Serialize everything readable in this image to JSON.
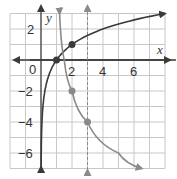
{
  "chart_data": {
    "type": "line",
    "title": "",
    "xlabel": "x",
    "ylabel": "y",
    "xlim": [
      -2,
      8
    ],
    "ylim": [
      -7,
      3
    ],
    "grid": true,
    "x_tick_labels": [
      "0",
      "2",
      "4",
      "6"
    ],
    "y_tick_labels": [
      "2",
      "-2",
      "-4",
      "-6"
    ],
    "series": [
      {
        "name": "dark curve",
        "color": "#3a3a3a",
        "style": "solid",
        "description": "logarithmic curve with vertical asymptote x = 0",
        "points": [
          [
            0.06,
            -6.9
          ],
          [
            0.25,
            -2
          ],
          [
            0.5,
            -1
          ],
          [
            1,
            0
          ],
          [
            2,
            1
          ],
          [
            4,
            2
          ],
          [
            8,
            3
          ]
        ],
        "marked_points": [
          [
            1,
            0
          ],
          [
            2,
            1
          ]
        ]
      },
      {
        "name": "gray curve",
        "color": "#8a8a8a",
        "style": "solid",
        "description": "decreasing logarithmic curve with vertical asymptote near x = 1",
        "points": [
          [
            1.2,
            3
          ],
          [
            1.5,
            0
          ],
          [
            2,
            -2
          ],
          [
            3,
            -4
          ],
          [
            5,
            -6
          ],
          [
            6.5,
            -7
          ]
        ],
        "marked_points": [
          [
            2,
            -2
          ],
          [
            3,
            -4
          ]
        ]
      }
    ],
    "annotations": [
      {
        "type": "dashed_vertical_line",
        "x": 3,
        "color": "#8a8a8a",
        "label": "asymptote"
      }
    ]
  },
  "labels": {
    "x_axis": "x",
    "y_axis": "y",
    "ticks_x": [
      "0",
      "2",
      "4",
      "6"
    ],
    "ticks_y": [
      "2",
      "−2",
      "−4",
      "−6"
    ]
  }
}
